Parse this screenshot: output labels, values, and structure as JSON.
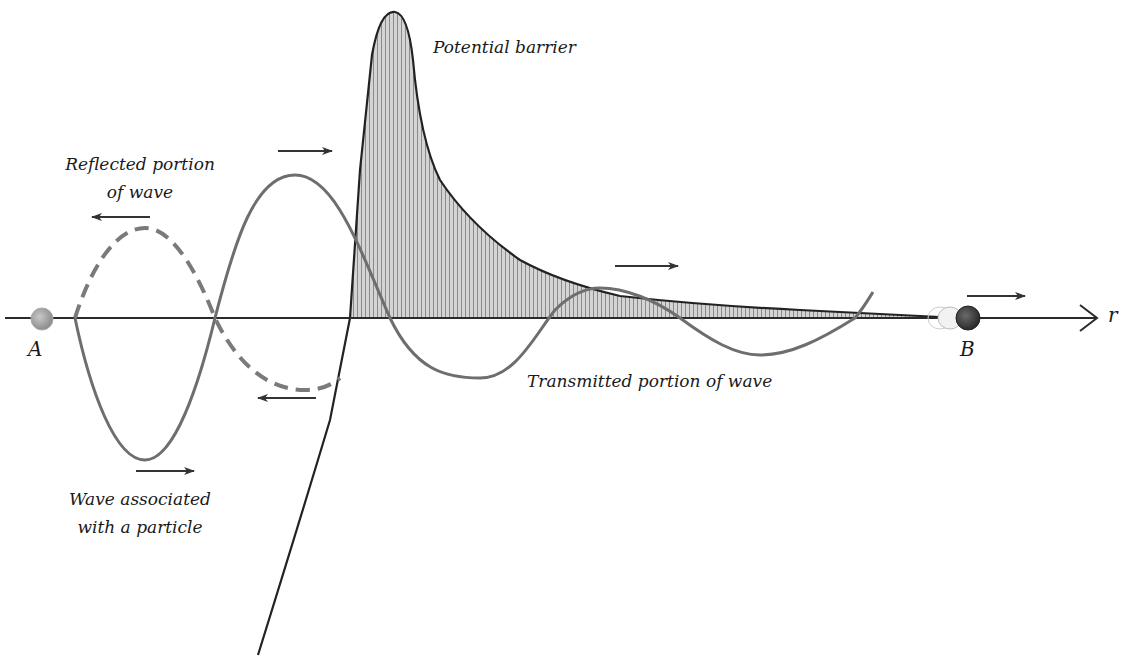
{
  "diagram": {
    "labels": {
      "potential_barrier": "Potential barrier",
      "reflected_line1": "Reflected portion",
      "reflected_line2": "of wave",
      "incident_line1": "Wave associated",
      "incident_line2": "with a particle",
      "transmitted": "Transmitted portion of wave",
      "point_a": "A",
      "point_b": "B",
      "axis": "r"
    },
    "colors": {
      "wave": "#6e6e6e",
      "axis": "#2a2a2a",
      "barrier_outline": "#222222",
      "barrier_fill": "#9a9a9a",
      "particle_a": "#a8a8a8",
      "particle_b": "#4a4a4a"
    },
    "elements": {
      "axis": {
        "y": 318,
        "x_start": 5,
        "x_end": 1097
      },
      "particle_a": {
        "x": 42,
        "y": 318
      },
      "particle_b": {
        "x": 968,
        "y": 318
      },
      "barrier_peak": {
        "x": 395,
        "y": 12
      },
      "arrows": [
        {
          "name": "incident-top",
          "direction": "right"
        },
        {
          "name": "incident-bottom",
          "direction": "right"
        },
        {
          "name": "reflected-top",
          "direction": "left"
        },
        {
          "name": "reflected-bottom",
          "direction": "left"
        },
        {
          "name": "transmitted",
          "direction": "right"
        },
        {
          "name": "particle-b-motion",
          "direction": "right"
        }
      ]
    }
  }
}
